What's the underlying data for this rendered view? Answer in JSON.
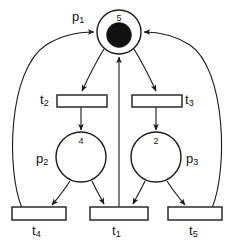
{
  "diagram": {
    "stroke_color": "#1a1a1a",
    "background_color": "#ffffff",
    "token_color": "#111111",
    "places": [
      {
        "id": "p1",
        "label": "p",
        "sub": "1",
        "marking": "5",
        "has_token": true
      },
      {
        "id": "p2",
        "label": "p",
        "sub": "2",
        "marking": "4",
        "has_token": false
      },
      {
        "id": "p3",
        "label": "p",
        "sub": "3",
        "marking": "2",
        "has_token": false
      }
    ],
    "transitions": [
      {
        "id": "t1",
        "label": "t",
        "sub": "1"
      },
      {
        "id": "t2",
        "label": "t",
        "sub": "2"
      },
      {
        "id": "t3",
        "label": "t",
        "sub": "3"
      },
      {
        "id": "t4",
        "label": "t",
        "sub": "4"
      },
      {
        "id": "t5",
        "label": "t",
        "sub": "5"
      }
    ],
    "arcs": [
      {
        "from": "p1",
        "to": "t2"
      },
      {
        "from": "p1",
        "to": "t3"
      },
      {
        "from": "t2",
        "to": "p2"
      },
      {
        "from": "t3",
        "to": "p3"
      },
      {
        "from": "p2",
        "to": "t4"
      },
      {
        "from": "p2",
        "to": "t1"
      },
      {
        "from": "p3",
        "to": "t1"
      },
      {
        "from": "p3",
        "to": "t5"
      },
      {
        "from": "t1",
        "to": "p1"
      },
      {
        "from": "t4",
        "to": "p1"
      },
      {
        "from": "t5",
        "to": "p1"
      }
    ]
  }
}
